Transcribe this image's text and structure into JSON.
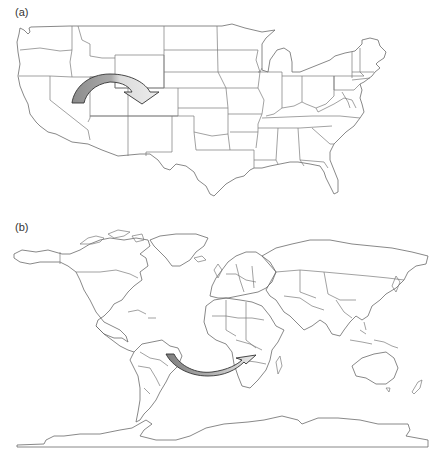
{
  "figure": {
    "panels": [
      {
        "label": "(a)",
        "map": "contiguous-united-states",
        "description": "Outline map of US states with curved arrow",
        "arrow": {
          "direction": "left-to-right, curving downward",
          "from_region": "Nevada/Utah",
          "to_region": "Colorado/Kansas",
          "start_color": "#8c8c8c",
          "end_color": "#e6e6e6"
        }
      },
      {
        "label": "(b)",
        "map": "world",
        "description": "Outline world map with country borders and curved arrow",
        "arrow": {
          "direction": "left-to-right, curving below",
          "from_region": "Brazil (South America)",
          "to_region": "Southern Africa",
          "start_color": "#8c8c8c",
          "end_color": "#e6e6e6"
        }
      }
    ],
    "colors": {
      "background": "#ffffff",
      "border_lines": "#7a7a7a",
      "arrow_outline": "#333333"
    }
  }
}
